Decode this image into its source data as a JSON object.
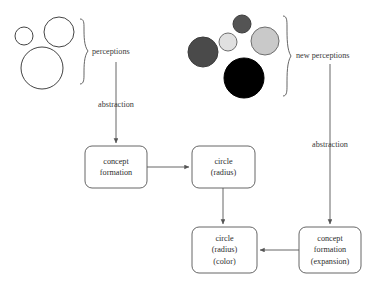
{
  "diagram": {
    "colors": {
      "stroke": "#555555",
      "text": "#2e2e2e",
      "label_text": "#3a3a3a",
      "box_fill": "#ffffff",
      "circle_outline_stroke": "#444444",
      "filled_dark_gray": "#4a4a4a",
      "filled_mid_gray": "#7d7d7d",
      "filled_light_gray": "#dcdcdc",
      "filled_light_gray_2": "#c8c8c8",
      "filled_black": "#000000"
    },
    "groups": [
      {
        "id": "perceptions-group",
        "label": "perceptions",
        "brace": "right-curly-brace",
        "circles": [
          {
            "name": "small-outline-circle",
            "cx": 24,
            "cy": 36,
            "r": 9,
            "fill": "none",
            "stroke": "#444444"
          },
          {
            "name": "medium-outline-circle",
            "cx": 59,
            "cy": 32,
            "r": 15,
            "fill": "none",
            "stroke": "#444444"
          },
          {
            "name": "large-outline-circle",
            "cx": 42,
            "cy": 68,
            "r": 21,
            "fill": "none",
            "stroke": "#444444"
          }
        ]
      },
      {
        "id": "new-perceptions-group",
        "label": "new perceptions",
        "brace": "right-curly-brace",
        "circles": [
          {
            "name": "dark-gray-top-circle",
            "cx": 242,
            "cy": 24,
            "r": 9,
            "fill": "#545454",
            "stroke": "#3c3c3c"
          },
          {
            "name": "light-gray-small-circle",
            "cx": 228,
            "cy": 42,
            "r": 9,
            "fill": "#e0e0e0",
            "stroke": "#6e6e6e"
          },
          {
            "name": "light-gray-large-circle",
            "cx": 265,
            "cy": 41,
            "r": 14,
            "fill": "#c9c9c9",
            "stroke": "#6e6e6e"
          },
          {
            "name": "dark-gray-left-circle",
            "cx": 203,
            "cy": 52,
            "r": 15,
            "fill": "#4a4a4a",
            "stroke": "#3c3c3c"
          },
          {
            "name": "black-circle",
            "cx": 244,
            "cy": 78,
            "r": 20,
            "fill": "#000000",
            "stroke": "#000000"
          }
        ]
      }
    ],
    "edge_labels": {
      "abstraction_left": "abstraction",
      "abstraction_right": "abstraction"
    },
    "boxes": [
      {
        "id": "concept-formation-box",
        "lines": [
          "concept",
          "formation"
        ],
        "x": 85,
        "y": 146,
        "w": 62,
        "h": 42
      },
      {
        "id": "circle-radius-box",
        "lines": [
          "circle",
          "(radius)"
        ],
        "x": 192,
        "y": 146,
        "w": 63,
        "h": 42
      },
      {
        "id": "circle-radius-color-box",
        "lines": [
          "circle",
          "(radius)",
          "(color)"
        ],
        "x": 192,
        "y": 227,
        "w": 65,
        "h": 46
      },
      {
        "id": "concept-formation-expansion-box",
        "lines": [
          "concept",
          "formation",
          "(expansion)"
        ],
        "x": 299,
        "y": 227,
        "w": 62,
        "h": 46
      }
    ]
  }
}
